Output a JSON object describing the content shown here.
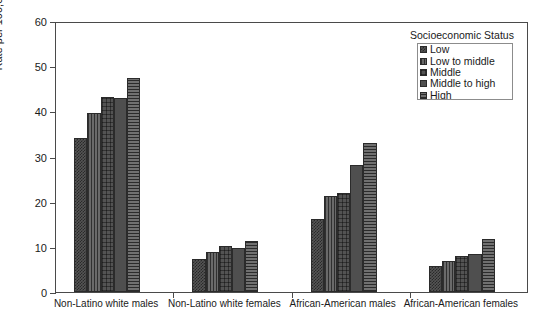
{
  "chart_data": {
    "type": "bar",
    "title": "",
    "xlabel": "",
    "ylabel": "Rate per 100,000",
    "ylim": [
      0,
      60
    ],
    "ytick_step": 10,
    "yticks": [
      0,
      10,
      20,
      30,
      40,
      50,
      60
    ],
    "grid": false,
    "legend_position": "top-right",
    "legend_title": "Socioeconomic Status",
    "categories": [
      "Non-Latino white males",
      "Non-Latino white females",
      "African-American males",
      "African-American females"
    ],
    "series": [
      {
        "name": "Low",
        "pattern": "cross-hatch-fine",
        "values": [
          34.0,
          7.3,
          16.1,
          5.8
        ]
      },
      {
        "name": "Low to middle",
        "pattern": "vertical-lines",
        "values": [
          39.6,
          8.8,
          21.3,
          6.8
        ]
      },
      {
        "name": "Middle",
        "pattern": "cross-hatch",
        "values": [
          43.1,
          10.2,
          21.9,
          8.0
        ]
      },
      {
        "name": "Middle to high",
        "pattern": "solid",
        "values": [
          43.0,
          9.8,
          28.1,
          8.4
        ]
      },
      {
        "name": "High",
        "pattern": "horizontal-lines",
        "values": [
          47.4,
          11.2,
          32.9,
          11.8
        ]
      }
    ]
  },
  "axis": {
    "y_title": "Rate per 100,000",
    "y_tick_labels": [
      "0",
      "10",
      "20",
      "30",
      "40",
      "50",
      "60"
    ]
  },
  "legend": {
    "title": "Socioeconomic Status",
    "items": [
      {
        "label": "Low"
      },
      {
        "label": "Low to middle"
      },
      {
        "label": "Middle"
      },
      {
        "label": "Middle to high"
      },
      {
        "label": "High"
      }
    ]
  }
}
